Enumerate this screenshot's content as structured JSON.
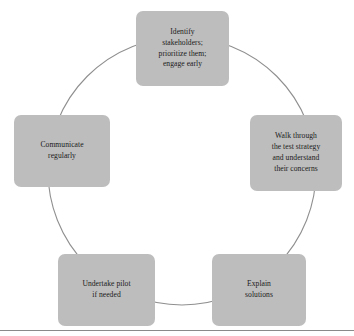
{
  "diagram": {
    "type": "cycle",
    "shape": "circle",
    "node_count": 5,
    "accent_color": "#bdbdbd",
    "line_color": "#8f8f8f",
    "text_color": "#1a1a1a",
    "background_color": "#ffffff",
    "circle": {
      "center_x": 182,
      "center_y": 171,
      "radius": 134,
      "stroke_width": 1
    },
    "nodes": [
      {
        "id": "identify",
        "position": "top",
        "label": "Identify\nstakeholders;\nprioritize them;\nengage early",
        "lines": [
          "Identify",
          "stakeholders;",
          "prioritize them;",
          "engage early"
        ]
      },
      {
        "id": "walk-through",
        "position": "right",
        "label": "Walk through\nthe test strategy\nand understand\ntheir concerns",
        "lines": [
          "Walk through",
          "the test strategy",
          "and understand",
          "their concerns"
        ]
      },
      {
        "id": "explain",
        "position": "bottom-right",
        "label": "Explain\nsolutions",
        "lines": [
          "Explain",
          "solutions"
        ]
      },
      {
        "id": "undertake-pilot",
        "position": "bottom-left",
        "label": "Undertake pilot\nif needed",
        "lines": [
          "Undertake pilot",
          "if needed"
        ]
      },
      {
        "id": "communicate",
        "position": "left",
        "label": "Communicate\nregularly",
        "lines": [
          "Communicate",
          "regularly"
        ]
      }
    ]
  }
}
